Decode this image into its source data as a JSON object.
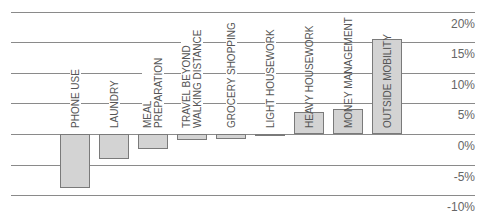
{
  "chart_data": {
    "type": "bar",
    "title": "",
    "xlabel": "",
    "ylabel": "",
    "categories": [
      "PHONE USE",
      "LAUNDRY",
      "MEAL PREPARATION",
      "TRAVEL BEYOND WALKING DISTANCE",
      "GROCERY SHOPPING",
      "LIGHT HOUSEWORK",
      "HEAVY HOUSEWORK",
      "MONEY MANAGEMENT",
      "OUTSIDE MOBILITY"
    ],
    "values": [
      -8.9,
      -4.1,
      -2.5,
      -0.9,
      -0.8,
      -0.3,
      3.6,
      4.1,
      15.6
    ],
    "ylim": [
      -10,
      20
    ],
    "yticks": [
      "20%",
      "15%",
      "10%",
      "5%",
      "0%",
      "-5%",
      "-10%"
    ],
    "ytick_values": [
      20,
      15,
      10,
      5,
      0,
      -5,
      -10
    ],
    "grid": true,
    "legend": null,
    "colors": {
      "bar_fill": "#d3d3d3",
      "bar_border": "#7a7a7a",
      "grid": "#8a8a8a",
      "text": "#555555"
    }
  },
  "labels": [
    {
      "text": "PHONE USE"
    },
    {
      "text": "LAUNDRY"
    },
    {
      "text": "MEAL\nPREPARATION"
    },
    {
      "text": "TRAVEL BEYOND\nWALKING DISTANCE"
    },
    {
      "text": "GROCERY SHOPPING"
    },
    {
      "text": "LIGHT HOUSEWORK"
    },
    {
      "text": "HEAVY HOUSEWORK"
    },
    {
      "text": "MONEY MANAGEMENT"
    },
    {
      "text": "OUTSIDE MOBILITY"
    }
  ]
}
